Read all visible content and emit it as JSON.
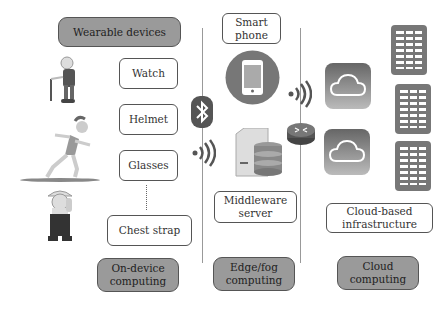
{
  "columns": {
    "on_device": {
      "header": "Wearable devices",
      "devices": [
        "Watch",
        "Helmet",
        "Glasses",
        "Chest strap"
      ],
      "footer": "On-device\ncomputing"
    },
    "edge_fog": {
      "top": "Smart\nphone",
      "server": "Middleware\nserver",
      "footer": "Edge/fog\ncomputing"
    },
    "cloud": {
      "infra": "Cloud-based\ninfrastructure",
      "footer": "Cloud\ncomputing"
    }
  },
  "icons": [
    "elderly-person",
    "runner",
    "worker",
    "bluetooth",
    "wifi",
    "smartphone",
    "database-server",
    "router",
    "cloud",
    "server-rack"
  ],
  "colors": {
    "accent_gray": "#9a9a9a",
    "border": "#555555",
    "icon_dark": "#555555"
  }
}
